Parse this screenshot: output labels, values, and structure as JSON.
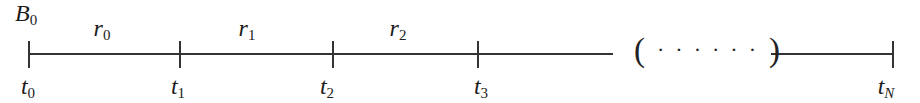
{
  "figure": {
    "colors": {
      "background": "#ffffff",
      "line": "#333333",
      "text": "#1c1c1c"
    },
    "balance_label": {
      "base": "B",
      "sub": "0"
    },
    "rate_labels": [
      {
        "base": "r",
        "sub": "0"
      },
      {
        "base": "r",
        "sub": "1"
      },
      {
        "base": "r",
        "sub": "2"
      }
    ],
    "time_labels": [
      {
        "base": "t",
        "sub": "0"
      },
      {
        "base": "t",
        "sub": "1"
      },
      {
        "base": "t",
        "sub": "2"
      },
      {
        "base": "t",
        "sub": "3"
      }
    ],
    "end_time_label": {
      "base": "t",
      "sub": "N"
    },
    "ellipsis": {
      "open_paren": "(",
      "dots": "······",
      "close_paren": ")"
    }
  }
}
